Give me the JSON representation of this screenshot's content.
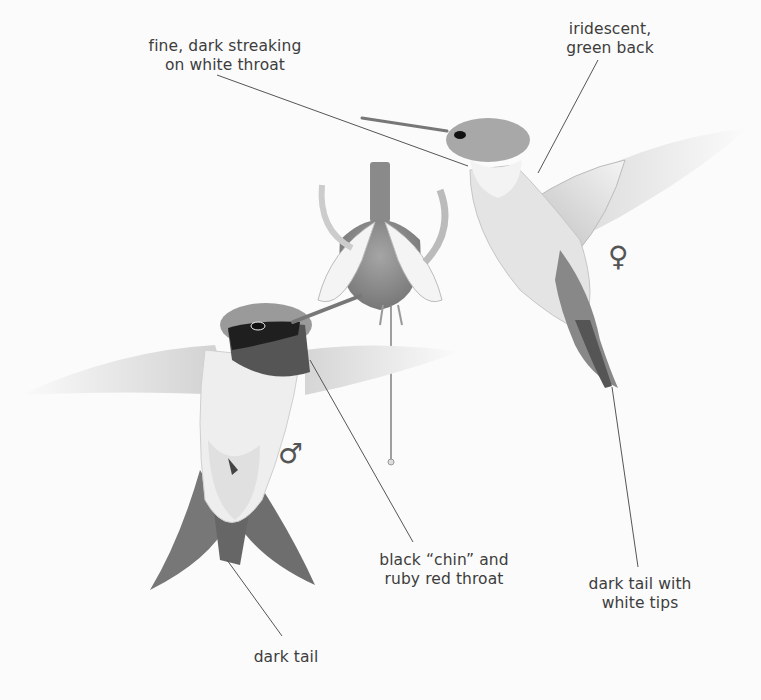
{
  "illustration": {
    "subject": "Ruby-throated hummingbird, male and female, with fuchsia flower",
    "style": "grayscale pencil illustration"
  },
  "labels": {
    "streaking": {
      "line1": "fine, dark streaking",
      "line2": "on white throat"
    },
    "back": {
      "line1": "iridescent,",
      "line2": "green back"
    },
    "chin": {
      "line1": "black “chin” and",
      "line2": "ruby red throat"
    },
    "tail_white": {
      "line1": "dark tail with",
      "line2": "white tips"
    },
    "tail": {
      "line1": "dark tail"
    }
  },
  "symbols": {
    "female": "♀",
    "male": "♂"
  },
  "colors": {
    "background": "#fbfbfb",
    "text": "#3d3d3d",
    "leader_line": "#555555",
    "gorget": "#4a4a4a",
    "head_dark": "#222222"
  }
}
